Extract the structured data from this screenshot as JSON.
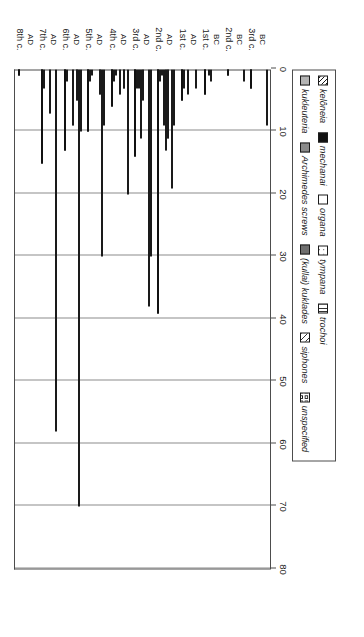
{
  "chart_data": {
    "type": "bar",
    "orientation": "horizontal",
    "title": "",
    "xlabel": "",
    "ylabel": "Water-lifting devices attested in papyri",
    "ylim": [
      0,
      80
    ],
    "yticks": [
      0,
      10,
      20,
      30,
      40,
      50,
      60,
      70,
      80
    ],
    "ytick_labels": [
      "0",
      "10",
      "20",
      "30",
      "40",
      "50",
      "60",
      "70",
      "80"
    ],
    "grid": true,
    "grid_axis": "value",
    "legend_position": "bottom",
    "categories": [
      {
        "name": "3rd c.",
        "era": "BC"
      },
      {
        "name": "2nd c.",
        "era": "BC"
      },
      {
        "name": "1st c.",
        "era": "BC"
      },
      {
        "name": "1st c.",
        "era": "AD"
      },
      {
        "name": "2nd c.",
        "era": "AD"
      },
      {
        "name": "3rd c.",
        "era": "AD"
      },
      {
        "name": "4th c.",
        "era": "AD"
      },
      {
        "name": "5th c.",
        "era": "AD"
      },
      {
        "name": "6th c.",
        "era": "AD"
      },
      {
        "name": "7th c.",
        "era": "AD"
      },
      {
        "name": "8th c.",
        "era": "AD"
      }
    ],
    "series": [
      {
        "name": "kelôneia",
        "pattern": "p-diagdark",
        "values": [
          0,
          0,
          0,
          0,
          0,
          0,
          0,
          0,
          0,
          0,
          0
        ]
      },
      {
        "name": "mechanai",
        "pattern": "p-solidblack",
        "values": [
          3,
          1,
          4,
          5,
          39,
          14,
          6,
          10,
          13,
          15,
          1
        ]
      },
      {
        "name": "organa",
        "pattern": "p-white",
        "values": [
          0,
          0,
          0,
          3,
          2,
          3,
          2,
          2,
          2,
          3,
          0
        ]
      },
      {
        "name": "tympana",
        "pattern": "p-dots",
        "values": [
          0,
          0,
          1,
          0,
          1,
          3,
          1,
          1,
          0,
          0,
          0
        ]
      },
      {
        "name": "trochoi",
        "pattern": "p-vlines",
        "values": [
          0,
          0,
          2,
          4,
          9,
          11,
          0,
          0,
          0,
          0,
          0
        ]
      },
      {
        "name": "kukleuteria",
        "pattern": "p-grayL",
        "values": [
          0,
          0,
          0,
          0,
          13,
          5,
          4,
          0,
          9,
          7,
          0
        ]
      },
      {
        "name": "Archimedes screws",
        "pattern": "p-grayM",
        "values": [
          0,
          0,
          0,
          0,
          11,
          0,
          0,
          0,
          0,
          0,
          0
        ]
      },
      {
        "name": "(kullai) kuklades",
        "pattern": "p-grayD",
        "values": [
          0,
          0,
          0,
          0,
          0,
          0,
          3,
          4,
          5,
          0,
          0
        ]
      },
      {
        "name": "siphones",
        "pattern": "p-diagfine",
        "values": [
          0,
          0,
          0,
          3,
          19,
          38,
          0,
          30,
          70,
          58,
          0
        ]
      },
      {
        "name": "unspecified",
        "pattern": "p-circles",
        "values": [
          9,
          2,
          0,
          0,
          9,
          30,
          20,
          9,
          10,
          0,
          0
        ]
      }
    ],
    "legend_entries": [
      {
        "label": "kelôneia",
        "pattern": "p-diagdark",
        "italic": true
      },
      {
        "label": "mechanai",
        "pattern": "p-solidblack",
        "italic": true
      },
      {
        "label": "organa",
        "pattern": "p-white",
        "italic": true
      },
      {
        "label": "tympana",
        "pattern": "p-dots",
        "italic": true
      },
      {
        "label": "trochoi",
        "pattern": "p-vlines",
        "italic": true
      },
      {
        "label": "kukleuteria",
        "pattern": "p-grayL",
        "italic": true
      },
      {
        "label": "Archimedes screws",
        "pattern": "p-grayM",
        "italic": true
      },
      {
        "label": "(kullai) kuklades",
        "pattern": "p-grayD",
        "italic": true
      },
      {
        "label": "siphones",
        "pattern": "p-diagfine",
        "italic": true
      },
      {
        "label": "unspecified",
        "pattern": "p-circles",
        "italic": true
      }
    ]
  },
  "axis": {
    "title": "Water-lifting devices attested in papyri"
  }
}
